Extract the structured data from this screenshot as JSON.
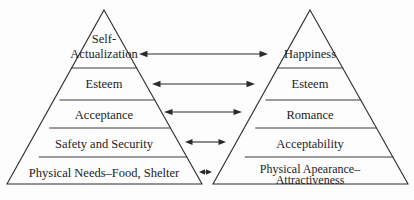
{
  "diagram": {
    "background_color": "#fdfdfd",
    "line_color": "#2e2e2e",
    "text_color": "#1c1c1c",
    "left_pyramid": {
      "name": "Maslow hierarchy of needs pyramid",
      "tiers": [
        {
          "id": "apex",
          "label_line1": "Self-",
          "label_line2": "Actualization"
        },
        {
          "id": "tier2",
          "label_line1": "Esteem",
          "label_line2": ""
        },
        {
          "id": "tier3",
          "label_line1": "Acceptance",
          "label_line2": ""
        },
        {
          "id": "tier4",
          "label_line1": "Safety and Security",
          "label_line2": ""
        },
        {
          "id": "tier5",
          "label_line1": "Physical Needs–Food, Shelter",
          "label_line2": ""
        }
      ]
    },
    "right_pyramid": {
      "name": "Appearance-based hierarchy pyramid",
      "tiers": [
        {
          "id": "apex",
          "label_line1": "Happiness",
          "label_line2": ""
        },
        {
          "id": "tier2",
          "label_line1": "Esteem",
          "label_line2": ""
        },
        {
          "id": "tier3",
          "label_line1": "Romance",
          "label_line2": ""
        },
        {
          "id": "tier4",
          "label_line1": "Acceptability",
          "label_line2": ""
        },
        {
          "id": "tier5",
          "label_line1": "Physical Apearance–",
          "label_line2": "Attractiveness"
        }
      ]
    },
    "connectors": [
      {
        "id": "connector-1",
        "kind": "double-headed-arrow",
        "connects": "Self-Actualization ↔ Happiness"
      },
      {
        "id": "connector-2",
        "kind": "double-headed-arrow",
        "connects": "Esteem ↔ Esteem"
      },
      {
        "id": "connector-3",
        "kind": "double-headed-arrow",
        "connects": "Acceptance ↔ Romance"
      },
      {
        "id": "connector-4",
        "kind": "double-headed-arrow",
        "connects": "Safety and Security ↔ Acceptability"
      },
      {
        "id": "connector-5",
        "kind": "double-headed-arrow",
        "connects": "Physical Needs ↔ Physical Apearance"
      }
    ]
  }
}
